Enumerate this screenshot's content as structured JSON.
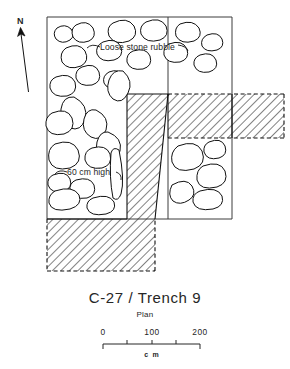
{
  "figure": {
    "title": "C-27 / Trench 9",
    "subtitle": "Plan",
    "north_label": "N",
    "annotations": {
      "rubble": "Loose stone rubble",
      "height": "60 cm high"
    },
    "scale": {
      "labels": [
        "0",
        "100",
        "200"
      ],
      "unit": "c m",
      "start_value": 0,
      "end_value": 200,
      "minor_ticks": [
        50,
        100,
        150
      ]
    },
    "colors": {
      "ink": "#111111",
      "edge": "#3d3d3d",
      "paper": "#ffffff",
      "hatch": "#262626"
    },
    "legend_notes": {
      "hatched_meaning": "unexcavated baulk",
      "outline_meaning": "stone"
    }
  }
}
